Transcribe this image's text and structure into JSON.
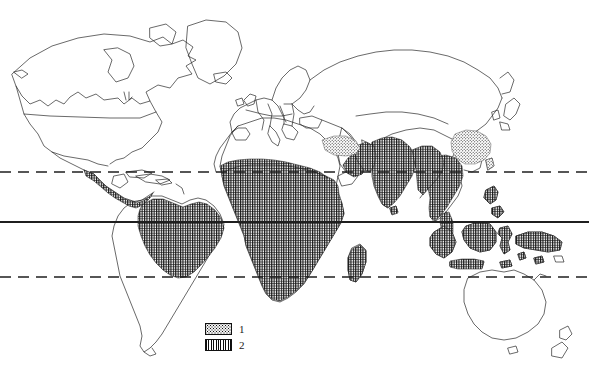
{
  "figure": {
    "type": "thematic-world-map",
    "projection": "equirectangular",
    "background_color": "#ffffff",
    "line_color": "#222222",
    "width": 589,
    "height": 382
  },
  "latitude_lines": [
    {
      "name": "tropic-of-cancer",
      "style": "dashed",
      "y": 172
    },
    {
      "name": "equator",
      "style": "solid",
      "y": 222
    },
    {
      "name": "tropic-of-capricorn",
      "style": "dashed",
      "y": 277
    }
  ],
  "legend": {
    "items": [
      {
        "label": "1",
        "pattern": "stipple",
        "swatch_name": "legend-swatch-stipple"
      },
      {
        "label": "2",
        "pattern": "vertical-hatch",
        "swatch_name": "legend-swatch-hatch"
      }
    ]
  },
  "regions": {
    "pattern_1_stipple": [
      "southern-china",
      "taiwan",
      "mesopotamia-iraq-iran"
    ],
    "pattern_2_hatch": [
      "central-america-pacific-coast",
      "amazon-basin-brazil",
      "northern-south-america",
      "sub-saharan-africa",
      "west-africa",
      "central-africa",
      "east-africa",
      "madagascar",
      "arabian-peninsula-south",
      "indian-subcontinent",
      "indochina",
      "malay-peninsula",
      "sumatra",
      "java",
      "borneo",
      "sulawesi",
      "new-guinea",
      "philippines"
    ],
    "unshaded": [
      "north-america",
      "greenland",
      "europe",
      "north-africa-sahara",
      "central-asia",
      "siberia",
      "japan",
      "australia",
      "new-zealand",
      "southern-south-america",
      "south-africa"
    ]
  }
}
